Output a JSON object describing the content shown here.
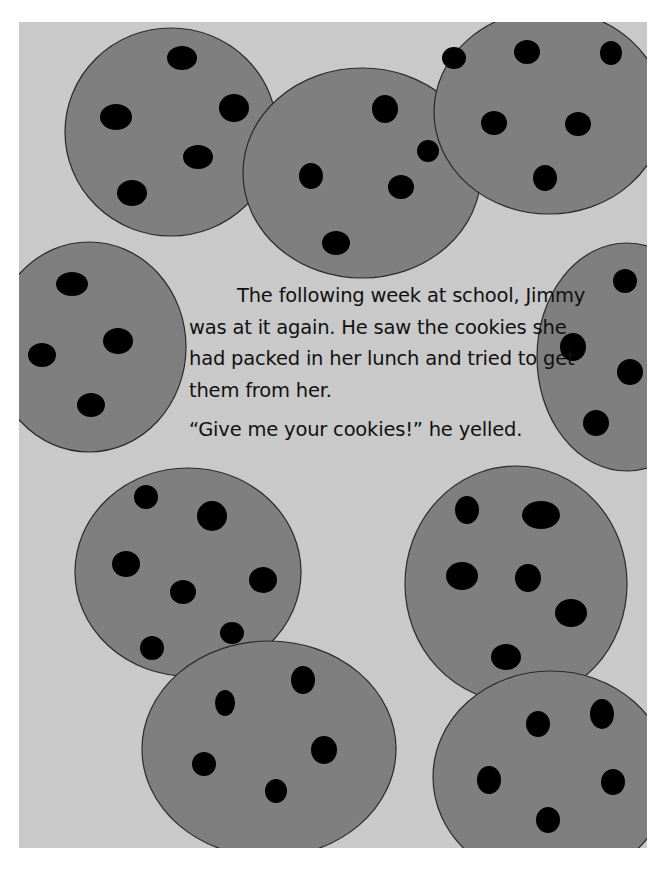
{
  "page": {
    "background_color": "#c9c9c9",
    "cookie_color": "#7f7f7f",
    "chip_color": "#000000",
    "outline_color": "#2a2a2a"
  },
  "story": {
    "paragraph": "The following week at school, Jimmy was at it again. He saw the cookies she had packed in her lunch and tried to get them from her.",
    "quote": "“Give me your cookies!” he yelled."
  },
  "cookies": [
    {
      "name": "cookie-top-left",
      "cx": 152,
      "cy": 110,
      "rx": 106,
      "ry": 104,
      "chips": [
        [
          163,
          36,
          15,
          12
        ],
        [
          97,
          95,
          16,
          13
        ],
        [
          215,
          86,
          15,
          14
        ],
        [
          179,
          135,
          15,
          12
        ],
        [
          113,
          171,
          15,
          13
        ]
      ]
    },
    {
      "name": "cookie-top-middle",
      "cx": 343,
      "cy": 151,
      "rx": 119,
      "ry": 105,
      "chips": [
        [
          366,
          87,
          13,
          14
        ],
        [
          409,
          129,
          11,
          11
        ],
        [
          292,
          154,
          12,
          13
        ],
        [
          382,
          165,
          13,
          12
        ],
        [
          317,
          221,
          14,
          12
        ]
      ]
    },
    {
      "name": "cookie-top-right",
      "cx": 530,
      "cy": 90,
      "rx": 115,
      "ry": 102,
      "chips": [
        [
          435,
          36,
          12,
          11
        ],
        [
          508,
          30,
          13,
          12
        ],
        [
          592,
          31,
          11,
          12
        ],
        [
          475,
          101,
          13,
          12
        ],
        [
          559,
          102,
          13,
          12
        ],
        [
          526,
          156,
          12,
          13
        ]
      ]
    },
    {
      "name": "cookie-mid-left",
      "cx": 70,
      "cy": 325,
      "rx": 97,
      "ry": 105,
      "chips": [
        [
          53,
          262,
          16,
          12
        ],
        [
          99,
          319,
          15,
          13
        ],
        [
          23,
          333,
          14,
          12
        ],
        [
          72,
          383,
          14,
          12
        ]
      ]
    },
    {
      "name": "cookie-mid-right",
      "cx": 608,
      "cy": 335,
      "rx": 90,
      "ry": 114,
      "chips": [
        [
          606,
          259,
          12,
          12
        ],
        [
          554,
          325,
          13,
          14
        ],
        [
          611,
          350,
          13,
          13
        ],
        [
          577,
          401,
          13,
          13
        ]
      ]
    },
    {
      "name": "cookie-bottom-left-top",
      "cx": 169,
      "cy": 550,
      "rx": 113,
      "ry": 104,
      "chips": [
        [
          127,
          475,
          12,
          12
        ],
        [
          193,
          494,
          15,
          15
        ],
        [
          107,
          542,
          14,
          13
        ],
        [
          244,
          558,
          14,
          13
        ],
        [
          164,
          570,
          13,
          12
        ],
        [
          213,
          611,
          12,
          11
        ],
        [
          133,
          626,
          12,
          12
        ]
      ]
    },
    {
      "name": "cookie-bottom-middle",
      "cx": 250,
      "cy": 727,
      "rx": 127,
      "ry": 108,
      "chips": [
        [
          284,
          658,
          12,
          14
        ],
        [
          206,
          681,
          10,
          13
        ],
        [
          305,
          728,
          13,
          14
        ],
        [
          185,
          742,
          12,
          12
        ],
        [
          257,
          769,
          11,
          12
        ]
      ]
    },
    {
      "name": "cookie-bottom-right-top",
      "cx": 497,
      "cy": 562,
      "rx": 111,
      "ry": 118,
      "chips": [
        [
          448,
          488,
          12,
          14
        ],
        [
          522,
          493,
          19,
          14
        ],
        [
          443,
          554,
          16,
          14
        ],
        [
          509,
          556,
          13,
          14
        ],
        [
          552,
          591,
          16,
          14
        ],
        [
          487,
          635,
          15,
          13
        ]
      ]
    },
    {
      "name": "cookie-bottom-right-bottom",
      "cx": 532,
      "cy": 755,
      "rx": 118,
      "ry": 106,
      "chips": [
        [
          519,
          702,
          12,
          13
        ],
        [
          583,
          692,
          12,
          15
        ],
        [
          470,
          758,
          12,
          14
        ],
        [
          594,
          760,
          12,
          13
        ],
        [
          529,
          798,
          12,
          13
        ]
      ]
    }
  ]
}
